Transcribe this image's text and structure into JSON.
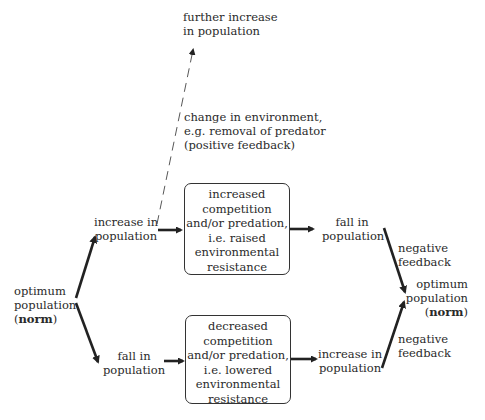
{
  "nodes": {
    "further_increase": {
      "lines": [
        "further increase",
        "in population"
      ]
    },
    "change_note": {
      "lines": [
        "change in environment,",
        "e.g. removal of predator",
        "(positive feedback)"
      ]
    },
    "increase_upper": {
      "lines": [
        "increase in",
        "population"
      ]
    },
    "increased_box": {
      "lines": [
        "increased",
        "competition",
        "and/or predation,",
        "i.e. raised",
        "environmental",
        "resistance"
      ]
    },
    "fall_upper": {
      "lines": [
        "fall in",
        "population"
      ]
    },
    "neg_feedback_upper": {
      "lines": [
        "negative",
        "feedback"
      ]
    },
    "optimum_left": {
      "lines": [
        "optimum",
        "population"
      ],
      "norm_open": "(",
      "norm": "norm",
      "norm_close": ")"
    },
    "optimum_right": {
      "lines": [
        "optimum",
        "population"
      ],
      "norm_open": "(",
      "norm": "norm",
      "norm_close": ")"
    },
    "neg_feedback_lower": {
      "lines": [
        "negative",
        "feedback"
      ]
    },
    "fall_lower": {
      "lines": [
        "fall in",
        "population"
      ]
    },
    "decreased_box": {
      "lines": [
        "decreased",
        "competition",
        "and/or predation,",
        "i.e. lowered",
        "environmental",
        "resistance"
      ]
    },
    "increase_lower": {
      "lines": [
        "increase in",
        "population"
      ]
    }
  },
  "edges": [
    {
      "from": "optimum_left",
      "to": "increase_upper",
      "style": "solid"
    },
    {
      "from": "optimum_left",
      "to": "fall_lower",
      "style": "solid"
    },
    {
      "from": "increase_upper",
      "to": "increased_box",
      "style": "solid"
    },
    {
      "from": "increase_upper",
      "to": "further_increase",
      "style": "dashed",
      "label": "change_note"
    },
    {
      "from": "increased_box",
      "to": "fall_upper",
      "style": "solid"
    },
    {
      "from": "fall_upper",
      "to": "optimum_right",
      "style": "solid",
      "label": "neg_feedback_upper"
    },
    {
      "from": "fall_lower",
      "to": "decreased_box",
      "style": "solid"
    },
    {
      "from": "decreased_box",
      "to": "increase_lower",
      "style": "solid"
    },
    {
      "from": "increase_lower",
      "to": "optimum_right",
      "style": "solid",
      "label": "neg_feedback_lower"
    }
  ],
  "colors": {
    "ink": "#2a2a2a",
    "background": "#ffffff"
  }
}
